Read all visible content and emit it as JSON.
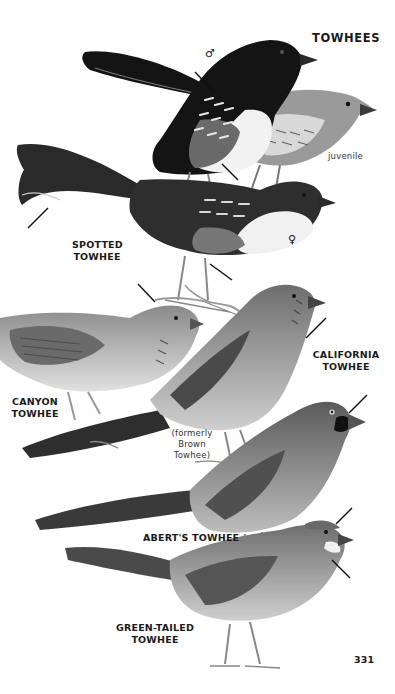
{
  "page": {
    "title": "TOWHEES",
    "page_number": "331"
  },
  "labels": {
    "male_symbol": "♂",
    "female_symbol": "♀",
    "juvenile": "juvenile",
    "spotted": "SPOTTED\nTOWHEE",
    "california": "CALIFORNIA\nTOWHEE",
    "canyon": "CANYON\nTOWHEE",
    "formerly": "(formerly\nBrown\nTowhee)",
    "aberts": "ABERT'S TOWHEE",
    "green_tailed": "GREEN-TAILED\nTOWHEE"
  },
  "colors": {
    "background": "#ffffff",
    "text": "#1a1a1a",
    "black_plumage": "#141414",
    "dark_gray": "#3a3a3a",
    "mid_gray": "#7a7a7a",
    "light_gray": "#b5b5b5",
    "pale": "#e6e6e6"
  }
}
